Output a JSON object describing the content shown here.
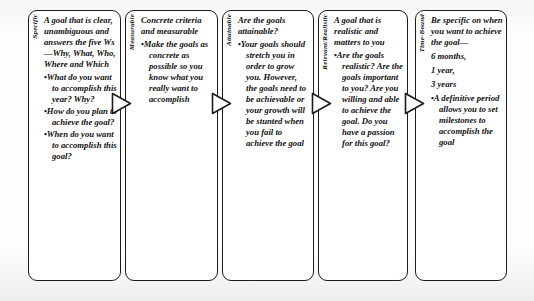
{
  "diagram": {
    "type": "flow",
    "arrow_icon": "right-flow-arrow",
    "colors": {
      "box_border": "#1c1c1c",
      "box_background": "#ffffff",
      "text": "#111111"
    },
    "columns": [
      {
        "label": "Specific",
        "intro": "A goal that is clear, unambiguous and answers the five Ws—Why, What, Who, Where and Which",
        "bullets": [
          "What do you want to accomplish this year? Why?",
          "How do you plan to achieve the goal?",
          "When do you want to accomplish this goal?"
        ]
      },
      {
        "label": "Measurable",
        "intro": "Concrete criteria and measurable",
        "bullets": [
          "Make the goals as concrete as possible so you know what you really want to accomplish"
        ]
      },
      {
        "label": "Attainable",
        "intro": "Are the goals attainable?",
        "bullets": [
          "Your goals should stretch you in order to grow you. However, the goals need to be achievable or your growth will be stunted when you fail to achieve the goal"
        ]
      },
      {
        "label": "Relevant/Realistic",
        "intro": "A goal that is realistic and matters to you",
        "bullets": [
          "Are the goals realistic? Are the goals important to you? Are you willing and able to achieve the goal.  Do you have a passion for this goal?"
        ]
      },
      {
        "label": "Time-Bound",
        "intro": "Be specific on when you want to achieve the goal—",
        "timeframes": [
          "6 months,",
          "1 year,",
          "3 years"
        ],
        "bullets": [
          "A definitive period allows you to set milestones to accomplish the goal"
        ]
      }
    ]
  }
}
